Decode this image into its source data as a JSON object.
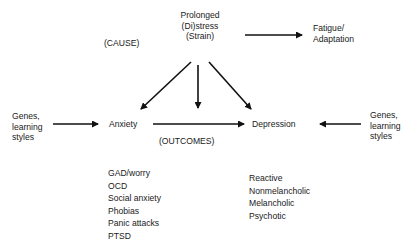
{
  "diagram": {
    "cause_node": {
      "lines": [
        "Prolonged",
        "(Di)stress",
        "(Strain)"
      ]
    },
    "cause_label": "(CAUSE)",
    "fatigue_node": {
      "lines": [
        "Fatigue/",
        "Adaptation"
      ]
    },
    "anxiety_node": "Anxiety",
    "depression_node": "Depression",
    "outcomes_label": "(OUTCOMES)",
    "genes_left": {
      "lines": [
        "Genes,",
        "learning",
        "styles"
      ]
    },
    "genes_right": {
      "lines": [
        "Genes,",
        "learning",
        "styles"
      ]
    },
    "anxiety_subtypes": [
      "GAD/worry",
      "OCD",
      "Social anxiety",
      "Phobias",
      "Panic attacks",
      "PTSD"
    ],
    "depression_subtypes": [
      "Reactive",
      "Nonmelancholic",
      "Melancholic",
      "Psychotic"
    ],
    "edges": [
      {
        "from": "Prolonged (Di)stress (Strain)",
        "to": "Fatigue/Adaptation"
      },
      {
        "from": "Prolonged (Di)stress (Strain)",
        "to": "Anxiety"
      },
      {
        "from": "Prolonged (Di)stress (Strain)",
        "to": "(OUTCOMES)"
      },
      {
        "from": "Prolonged (Di)stress (Strain)",
        "to": "Depression"
      },
      {
        "from": "Genes, learning styles (left)",
        "to": "Anxiety"
      },
      {
        "from": "Anxiety",
        "to": "Depression"
      },
      {
        "from": "Genes, learning styles (right)",
        "to": "Depression"
      }
    ],
    "colors": {
      "text": "#1a1a1a",
      "arrows": "#111111",
      "background": "#ffffff"
    }
  }
}
